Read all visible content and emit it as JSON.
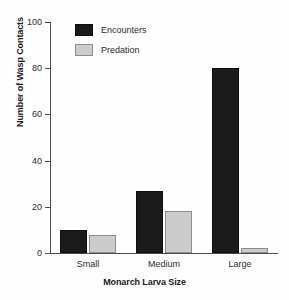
{
  "chart_data": {
    "type": "bar",
    "title": "",
    "xlabel": "Monarch Larva Size",
    "ylabel": "Number of Wasp Contacts",
    "categories": [
      "Small",
      "Medium",
      "Large"
    ],
    "series": [
      {
        "name": "Encounters",
        "values": [
          10,
          27,
          80
        ],
        "color": "#1a1a1a"
      },
      {
        "name": "Predation",
        "values": [
          8,
          18,
          2
        ],
        "color": "#cccccc"
      }
    ],
    "ylim": [
      0,
      100
    ],
    "yticks": [
      0,
      20,
      40,
      60,
      80,
      100
    ],
    "grid": false,
    "legend_position": "top-left-inside"
  },
  "legend": {
    "items": [
      {
        "label": "Encounters",
        "swatch": "black-swatch-icon"
      },
      {
        "label": "Predation",
        "swatch": "gray-swatch-icon"
      }
    ]
  },
  "axes": {
    "y_tick_labels": [
      "0",
      "20",
      "40",
      "60",
      "80",
      "100"
    ],
    "x_tick_labels": [
      "Small",
      "Medium",
      "Large"
    ]
  }
}
